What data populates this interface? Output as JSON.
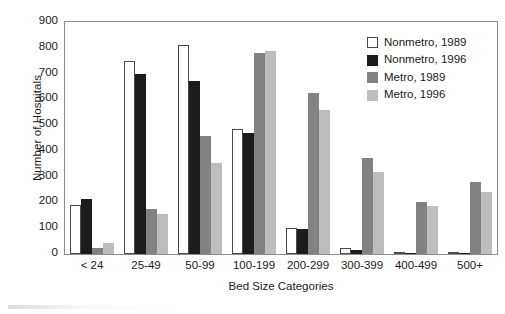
{
  "chart_data": {
    "type": "bar",
    "title": "",
    "xlabel": "Bed Size Categories",
    "ylabel": "Number of Hospitals",
    "categories": [
      "< 24",
      "25-49",
      "50-99",
      "100-199",
      "200-299",
      "300-399",
      "400-499",
      "500+"
    ],
    "series": [
      {
        "name": "Nonmetro, 1989",
        "color": "#ffffff",
        "values": [
          190,
          748,
          810,
          485,
          102,
          22,
          2,
          2
        ]
      },
      {
        "name": "Nonmetro, 1996",
        "color": "#1c1c1c",
        "values": [
          212,
          697,
          673,
          468,
          97,
          17,
          4,
          4
        ]
      },
      {
        "name": "Metro, 1989",
        "color": "#828282",
        "values": [
          25,
          175,
          458,
          778,
          623,
          372,
          203,
          278
        ]
      },
      {
        "name": "Metro, 1996",
        "color": "#bdbdbd",
        "values": [
          42,
          157,
          352,
          787,
          560,
          317,
          185,
          240
        ]
      }
    ],
    "ylim": [
      0,
      900
    ],
    "yticks": [
      0,
      100,
      200,
      300,
      400,
      500,
      600,
      700,
      800,
      900
    ],
    "grid": false,
    "legend_position": "top-right",
    "legend_entries": [
      "Nonmetro, 1989",
      "Nonmetro, 1996",
      "Metro, 1989",
      "Metro, 1996"
    ]
  }
}
